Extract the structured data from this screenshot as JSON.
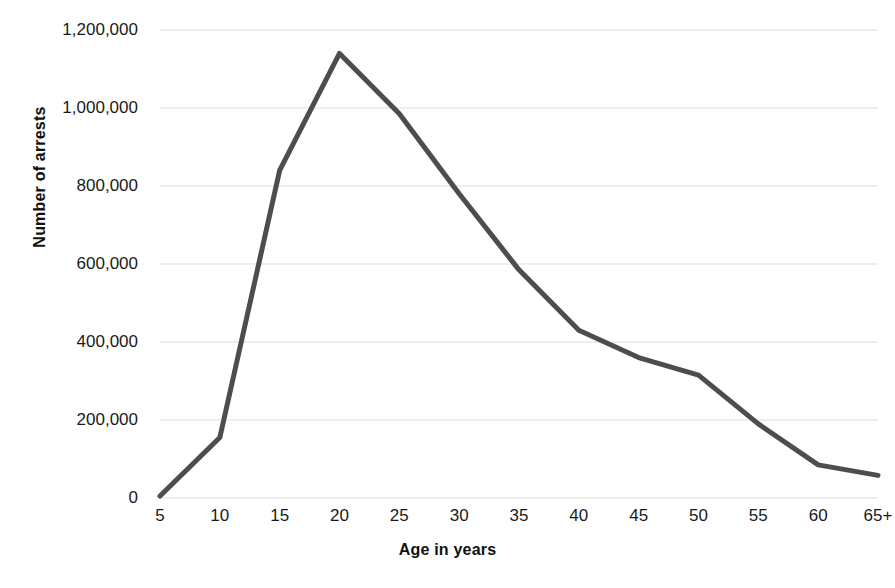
{
  "chart_data": {
    "type": "line",
    "title": "",
    "subtitle": "",
    "xlabel": "Age in years",
    "ylabel": "Number  of arrests",
    "categories": [
      "5",
      "10",
      "15",
      "20",
      "25",
      "30",
      "35",
      "40",
      "45",
      "50",
      "55",
      "60",
      "65+"
    ],
    "values": [
      5000,
      155000,
      840000,
      1140000,
      985000,
      780000,
      585000,
      430000,
      360000,
      315000,
      190000,
      85000,
      58000
    ],
    "series": [
      {
        "name": "Number of arrests",
        "values": [
          5000,
          155000,
          840000,
          1140000,
          985000,
          780000,
          585000,
          430000,
          360000,
          315000,
          190000,
          85000,
          58000
        ]
      }
    ],
    "ylim": [
      0,
      1200000
    ],
    "yticks": [
      0,
      200000,
      400000,
      600000,
      800000,
      1000000,
      1200000
    ],
    "ytick_labels": [
      "0",
      "200,000",
      "400,000",
      "600,000",
      "800,000",
      "1,000,000",
      "1,200,000"
    ],
    "grid": true,
    "grid_axis": "y",
    "legend": false,
    "legend_position": "none",
    "line_color": "#4d4d4d",
    "line_width": 5,
    "grid_color": "#e9e9e9",
    "background_color": "#ffffff",
    "text_color": "#1a1a1a"
  }
}
